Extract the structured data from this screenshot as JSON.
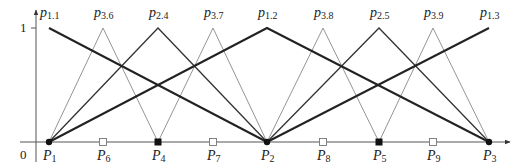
{
  "diagram": {
    "axis": {
      "y_tick_label": "1",
      "origin_label": "0"
    },
    "geometry": {
      "baseline_y": 142,
      "top_y": 28,
      "yaxis_x": 36
    },
    "nodes": [
      {
        "id": "P1",
        "base": "P",
        "sub": "1",
        "x": 49,
        "marker": "dot"
      },
      {
        "id": "P6",
        "base": "P",
        "sub": "6",
        "x": 103,
        "marker": "open-square"
      },
      {
        "id": "P4",
        "base": "P",
        "sub": "4",
        "x": 158,
        "marker": "filled-square"
      },
      {
        "id": "P7",
        "base": "P",
        "sub": "7",
        "x": 213,
        "marker": "open-square"
      },
      {
        "id": "P2",
        "base": "P",
        "sub": "2",
        "x": 267,
        "marker": "dot"
      },
      {
        "id": "P8",
        "base": "P",
        "sub": "8",
        "x": 323,
        "marker": "open-square"
      },
      {
        "id": "P5",
        "base": "P",
        "sub": "5",
        "x": 379,
        "marker": "filled-square"
      },
      {
        "id": "P9",
        "base": "P",
        "sub": "9",
        "x": 433,
        "marker": "open-square"
      },
      {
        "id": "P3",
        "base": "P",
        "sub": "3",
        "x": 489,
        "marker": "dot"
      }
    ],
    "basis_functions": [
      {
        "id": "p1.1",
        "base": "p",
        "sub": "1.1",
        "peak_x": 49,
        "left_x": 49,
        "right_x": 267,
        "level": 1
      },
      {
        "id": "p3.6",
        "base": "p",
        "sub": "3.6",
        "peak_x": 103,
        "left_x": 49,
        "right_x": 158,
        "level": 3
      },
      {
        "id": "p2.4",
        "base": "p",
        "sub": "2.4",
        "peak_x": 158,
        "left_x": 49,
        "right_x": 267,
        "level": 2
      },
      {
        "id": "p3.7",
        "base": "p",
        "sub": "3.7",
        "peak_x": 213,
        "left_x": 158,
        "right_x": 267,
        "level": 3
      },
      {
        "id": "p1.2",
        "base": "p",
        "sub": "1.2",
        "peak_x": 267,
        "left_x": 49,
        "right_x": 489,
        "level": 1
      },
      {
        "id": "p3.8",
        "base": "p",
        "sub": "3.8",
        "peak_x": 323,
        "left_x": 267,
        "right_x": 379,
        "level": 3
      },
      {
        "id": "p2.5",
        "base": "p",
        "sub": "2.5",
        "peak_x": 379,
        "left_x": 267,
        "right_x": 489,
        "level": 2
      },
      {
        "id": "p3.9",
        "base": "p",
        "sub": "3.9",
        "peak_x": 433,
        "left_x": 379,
        "right_x": 489,
        "level": 3
      },
      {
        "id": "p1.3",
        "base": "p",
        "sub": "1.3",
        "peak_x": 489,
        "left_x": 267,
        "right_x": 489,
        "level": 1
      }
    ],
    "styles": {
      "level1_color": "#222222",
      "level1_width": 2.0,
      "level2_color": "#333333",
      "level2_width": 1.3,
      "level3_color": "#888888",
      "level3_width": 0.9,
      "axis_color": "#555555"
    }
  }
}
